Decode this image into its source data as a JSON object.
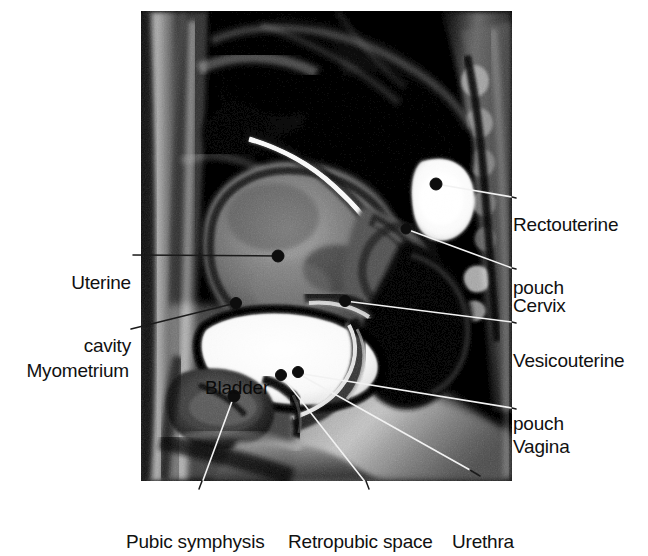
{
  "figure": {
    "type": "medical-image-figure",
    "modality": "MRI",
    "view": "midsagittal section of female pelvis",
    "image_region": {
      "x": 141,
      "y": 11,
      "width": 371,
      "height": 470
    },
    "background_color": "#ffffff",
    "text_color": "#111111",
    "leader_line_light": "#f2f2f2",
    "leader_line_dark": "#1a1a1a",
    "marker_color": "#0d0d0d"
  },
  "labels": {
    "rectouterine_pouch_line1": "Rectouterine",
    "rectouterine_pouch_line2": "pouch",
    "cervix": "Cervix",
    "vesicouterine_pouch_line1": "Vesicouterine",
    "vesicouterine_pouch_line2": "pouch",
    "vagina": "Vagina",
    "uterine_cavity_line1": "Uterine",
    "uterine_cavity_line2": "cavity",
    "myometrium": "Myometrium",
    "bladder": "Bladder",
    "pubic_symphysis": "Pubic symphysis",
    "retropubic_space": "Retropubic space",
    "urethra": "Urethra"
  },
  "annotations": [
    {
      "name": "rectouterine-pouch",
      "text": "Rectouterine pouch",
      "side": "right",
      "marker": [
        436,
        184
      ],
      "leader": [
        [
          436,
          184
        ],
        [
          512,
          197
        ]
      ]
    },
    {
      "name": "cervix",
      "text": "Cervix",
      "side": "right",
      "marker": [
        406,
        229
      ],
      "leader": [
        [
          406,
          229
        ],
        [
          512,
          268
        ]
      ]
    },
    {
      "name": "vesicouterine-pouch",
      "text": "Vesicouterine pouch",
      "side": "right",
      "marker": [
        345,
        301
      ],
      "leader": [
        [
          345,
          301
        ],
        [
          512,
          322
        ]
      ]
    },
    {
      "name": "vagina",
      "text": "Vagina",
      "side": "right",
      "marker": [
        297,
        373
      ],
      "leader": [
        [
          297,
          373
        ],
        [
          512,
          408
        ]
      ]
    },
    {
      "name": "uterine-cavity",
      "text": "Uterine cavity",
      "side": "left",
      "marker": [
        278,
        256
      ],
      "leader": [
        [
          138,
          255
        ],
        [
          278,
          256
        ]
      ]
    },
    {
      "name": "myometrium",
      "text": "Myometrium",
      "side": "left",
      "marker": [
        236,
        303
      ],
      "leader": [
        [
          141,
          325
        ],
        [
          236,
          303
        ]
      ]
    },
    {
      "name": "bladder",
      "text": "Bladder",
      "side": "in-image",
      "marker": null,
      "leader": null
    },
    {
      "name": "pubic-symphysis",
      "text": "Pubic symphysis",
      "side": "bottom",
      "marker": [
        234,
        396
      ],
      "leader": [
        [
          234,
          396
        ],
        [
          202,
          483
        ]
      ]
    },
    {
      "name": "retropubic-space",
      "text": "Retropubic space",
      "side": "bottom",
      "marker": [
        281,
        375
      ],
      "leader": [
        [
          281,
          375
        ],
        [
          366,
          483
        ]
      ]
    },
    {
      "name": "urethra",
      "text": "Urethra",
      "side": "bottom",
      "marker": [
        297,
        373
      ],
      "leader": [
        [
          297,
          373
        ],
        [
          478,
          460
        ]
      ]
    }
  ]
}
